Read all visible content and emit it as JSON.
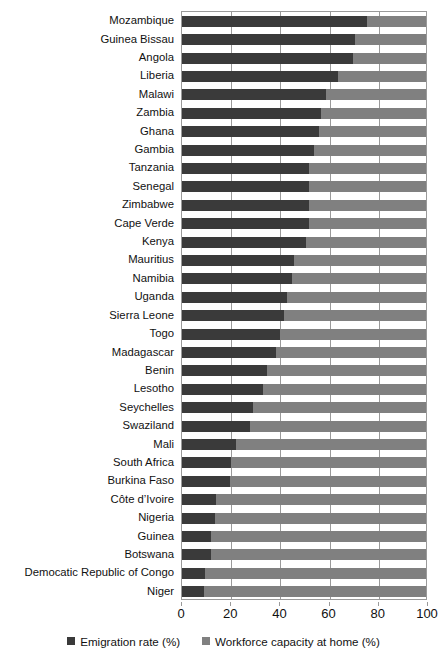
{
  "chart_data": {
    "type": "bar",
    "orientation": "horizontal",
    "stacked": true,
    "title": "",
    "subtitle": "",
    "xlabel": "",
    "ylabel": "",
    "xlim": [
      0,
      100
    ],
    "xticks": [
      0,
      20,
      40,
      60,
      80,
      100
    ],
    "xtick_labels": [
      "0",
      "20",
      "40",
      "60",
      "80",
      "100"
    ],
    "grid": true,
    "grid_axis": "x",
    "legend_position": "bottom",
    "legend": [
      {
        "label": "Emigration rate (%)",
        "color": "#3a3a3a",
        "marker": "square"
      },
      {
        "label": "Workforce capacity at home (%)",
        "color": "#808080",
        "marker": "square"
      }
    ],
    "categories": [
      "Mozambique",
      "Guinea Bissau",
      "Angola",
      "Liberia",
      "Malawi",
      "Zambia",
      "Ghana",
      "Gambia",
      "Tanzania",
      "Senegal",
      "Zimbabwe",
      "Cape Verde",
      "Kenya",
      "Mauritius",
      "Namibia",
      "Uganda",
      "Sierra Leone",
      "Togo",
      "Madagascar",
      "Benin",
      "Lesotho",
      "Seychelles",
      "Swaziland",
      "Mali",
      "South Africa",
      "Burkina Faso",
      "Côte d’Ivoire",
      "Nigeria",
      "Guinea",
      "Botswana",
      "Democatic Republic of Congo",
      "Niger"
    ],
    "series": [
      {
        "name": "Emigration rate (%)",
        "color": "#3a3a3a",
        "values": [
          76,
          71,
          70,
          64,
          59,
          57,
          56,
          54,
          52,
          52,
          52,
          52,
          51,
          46,
          45,
          43,
          42,
          40,
          38.5,
          35,
          33,
          29,
          28,
          22,
          20,
          19.5,
          14,
          13.5,
          12,
          12,
          9.5,
          9
        ]
      },
      {
        "name": "Workforce capacity at home (%)",
        "color": "#808080",
        "values": [
          24,
          29,
          30,
          36,
          41,
          43,
          44,
          46,
          48,
          48,
          48,
          48,
          49,
          54,
          55,
          57,
          58,
          60,
          61.5,
          65,
          67,
          71,
          72,
          78,
          80,
          80.5,
          86,
          86.5,
          88,
          88,
          90.5,
          91
        ]
      }
    ]
  },
  "colors": {
    "dark_series": "#3a3a3a",
    "light_series": "#808080",
    "gridline": "#9a9a9a",
    "plot_border": "#9a9a9a",
    "background": "#ffffff",
    "text": "#111111"
  }
}
